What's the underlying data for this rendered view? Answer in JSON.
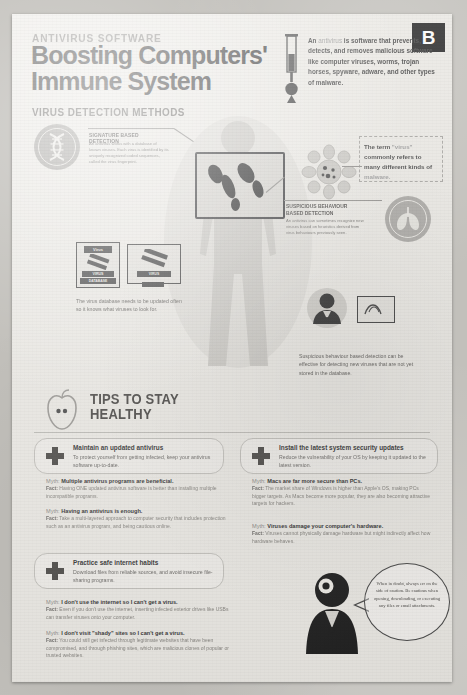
{
  "page": {
    "badge": "B",
    "kicker": "ANTIVIRUS SOFTWARE",
    "title_line1": "Boosting Computers'",
    "title_line2": "Immune System",
    "section_header": "VIRUS DETECTION METHODS",
    "accent_dark": "#1d1d1d",
    "paper": "#ebe9e4",
    "text": "#4a4a4a"
  },
  "intro": {
    "lead": "An ",
    "term": "antivirus",
    "body": " is software that prevents, detects, and removes malicious software like computer viruses, worms, trojan horses, spyware, adware, and other types of malware."
  },
  "signature": {
    "heading": "SIGNATURE BASED DETECTION",
    "body": "An antivirus works with a database of known viruses. Each virus is identified by its uniquely recognized coded sequences, called the virus fingerprint."
  },
  "term_note": {
    "lead": "The term ",
    "quoted": "\"virus\"",
    "mid": " commonly refers to many different kinds of ",
    "tail": "malware."
  },
  "suspicious": {
    "heading_line1": "SUSPICIOUS BEHAVIOUR",
    "heading_line2": "BASED DETECTION",
    "body": "An antivirus can sometimes recognize new viruses based on heuristics derived from virus behaviours previously seen."
  },
  "database": {
    "card_label_top": "Virus",
    "card_label_mid": "VIRUS",
    "card_label_bottom": "DATABASE",
    "caption": "The virus database needs to be updated often so it knows what viruses to look for."
  },
  "suspicious_caption": {
    "caption": "Suspicious behaviour based detection can be effective for detecting new viruses that are not yet stored in the database."
  },
  "tips": {
    "title_line1": "TIPS TO STAY",
    "title_line2": "HEALTHY",
    "cards": [
      {
        "heading": "Maintain an updated antivirus",
        "body": "To protect yourself from getting infected, keep your antivirus software up-to-date."
      },
      {
        "heading": "Install the latest system security updates",
        "body": "Reduce the vulnerability of your OS by keeping it updated to the latest version."
      },
      {
        "heading": "Practice safe internet habits",
        "body": "Download files from reliable sources, and avoid insecure file-sharing programs."
      }
    ],
    "myth_label": "Myth:",
    "fact_label": "Fact:",
    "myths_left": [
      {
        "myth": "Multiple antivirus programs are beneficial.",
        "fact": "Having ONE updated antivirus software is better than installing multiple incompatible programs."
      },
      {
        "myth": "Having an antivirus is enough.",
        "fact": "Take a multi-layered approach to computer security that includes protection such as an antivirus program, and being cautious online."
      },
      {
        "myth": "I don't use the internet so I can't get a virus.",
        "fact": "Even if you don't use the internet, inserting infected exterior drives like USBs can transfer viruses onto your computer."
      },
      {
        "myth": "I don't visit \"shady\" sites so I can't get a virus.",
        "fact": "You could still get infected through legitimate websites that have been compromised, and through phishing sites, which are malicious clones of popular or trusted websites."
      }
    ],
    "myths_right": [
      {
        "myth": "Macs are far more secure than PCs.",
        "fact": "The market share of Windows is higher than Apple's OS, making PCs bigger targets. As Macs become more popular, they are also becoming attractive targets for hackers."
      },
      {
        "myth": "Viruses damage your computer's hardware.",
        "fact": "Viruses cannot physically damage hardware but might indirectly affect how hardware behaves."
      }
    ]
  },
  "advice_bubble": {
    "text": "When in doubt, always err on the side of caution. Be cautious when opening, downloading, or executing any files or email attachments."
  }
}
